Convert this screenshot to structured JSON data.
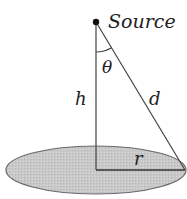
{
  "diagram": {
    "labels": {
      "source": "Source",
      "theta": "θ",
      "height": "h",
      "distance": "d",
      "radius": "r"
    },
    "geometry": {
      "source_point": [
        96,
        22
      ],
      "disk_center": [
        96,
        170
      ],
      "disk_rx": 90,
      "disk_ry": 24,
      "disk_edge_point": [
        185,
        170
      ],
      "angle_arc_radius": 30
    },
    "colors": {
      "stroke": "#333333",
      "disk_fill": "#c8c8c8",
      "disk_stroke": "#555555",
      "text": "#222222",
      "background": "#ffffff"
    }
  }
}
